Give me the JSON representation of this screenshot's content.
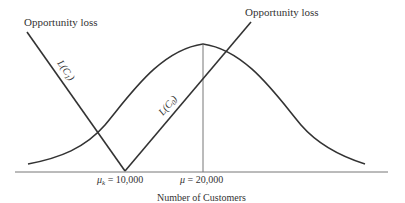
{
  "diagram": {
    "type": "opportunity-loss-diagram",
    "labels": {
      "left_axis_label": "Opportunity loss",
      "right_axis_label": "Opportunity loss",
      "loss_c1": "L(C",
      "loss_c1_sub": "1",
      "loss_c0": "L(C",
      "loss_c0_sub": "0",
      "paren_close": ")",
      "mu_k_symbol": "μ",
      "mu_k_sub": "k",
      "mu_k_value": " = 10,000",
      "mu_symbol": "μ",
      "mu_value": " = 20,000",
      "x_axis_title": "Number of Customers"
    },
    "points": {
      "breakeven_mu_k": 10000,
      "mean_mu": 20000
    },
    "elements": [
      "normal distribution curve centered at μ = 20,000",
      "L(C1) loss line descending to zero at μk",
      "L(C0) loss line rising from zero at μk",
      "vertical line at μ"
    ],
    "colors": {
      "line": "#333333",
      "axis": "#666666",
      "background": "#ffffff"
    }
  }
}
